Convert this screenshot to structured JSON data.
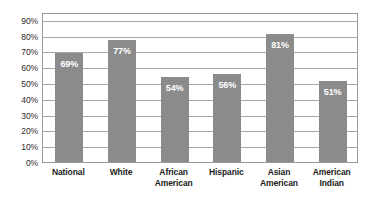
{
  "chart_data": {
    "type": "bar",
    "title": "",
    "subtitle": "",
    "xlabel": "",
    "ylabel": "",
    "categories": [
      "National",
      "White",
      "African American",
      "Hispanic",
      "Asian American",
      "American Indian"
    ],
    "category_lines": [
      [
        "National"
      ],
      [
        "White"
      ],
      [
        "African",
        "American"
      ],
      [
        "Hispanic"
      ],
      [
        "Asian",
        "American"
      ],
      [
        "American",
        "Indian"
      ]
    ],
    "values": [
      69,
      77,
      54,
      56,
      81,
      51
    ],
    "data_labels": [
      "69%",
      "77%",
      "54%",
      "56%",
      "81%",
      "51%"
    ],
    "ylim": [
      0,
      95
    ],
    "y_ticks": [
      0,
      10,
      20,
      30,
      40,
      50,
      60,
      70,
      80,
      90
    ],
    "y_tick_labels": [
      "0%",
      "10%",
      "20%",
      "30%",
      "40%",
      "50%",
      "60%",
      "70%",
      "80%",
      "90%"
    ],
    "grid": true,
    "grid_axis": "y",
    "legend": false,
    "legend_position": "none",
    "bar_color": "#8b8b8b",
    "data_label_color": "#ffffff",
    "grid_color": "#a8a8a8",
    "plot_border_color": "#9a9a9a",
    "background_color": "#ffffff",
    "axis_text_color": "#2b2b2b",
    "category_text_color": "#1c1c1c"
  }
}
